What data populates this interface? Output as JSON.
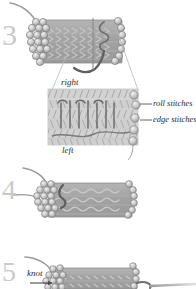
{
  "figure": {
    "background_color": "#ffffff",
    "band_fill": "#a8a8a8",
    "bead_fill": "#c4c4c4",
    "thread_color": "#6b6b6b",
    "outline_color": "#7a7a7a",
    "label_color": "#2b2b2b",
    "number_color": "#c9c9c9"
  },
  "steps": [
    {
      "number": "3"
    },
    {
      "number": "4"
    },
    {
      "number": "5"
    }
  ],
  "labels": {
    "right": "right",
    "left": "left",
    "roll_stitches": "roll stitches",
    "edge_stitches": "edge stitches",
    "knot": "knot"
  }
}
